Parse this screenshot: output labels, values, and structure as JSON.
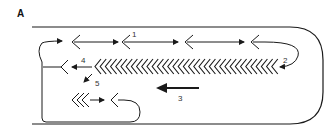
{
  "figure": {
    "panel_label": "A",
    "labels": {
      "l1": "1",
      "l2": "2",
      "l3": "3",
      "l4": "4",
      "l5": "5"
    },
    "colors": {
      "stroke": "#1a1a1a",
      "background": "#ffffff"
    }
  }
}
